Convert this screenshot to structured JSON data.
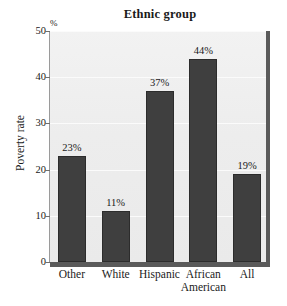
{
  "chart_data": {
    "type": "bar",
    "title": "Ethnic group",
    "xlabel": "",
    "ylabel": "Poverty rate",
    "unit_marker": "%",
    "categories": [
      "Other",
      "White",
      "Hispanic",
      "African\nAmerican",
      "All"
    ],
    "values": [
      23,
      11,
      37,
      44,
      19
    ],
    "data_labels": [
      "23%",
      "11%",
      "37%",
      "44%",
      "19%"
    ],
    "ylim": [
      0,
      50
    ],
    "yticks": [
      0,
      10,
      20,
      30,
      40,
      50
    ],
    "ytick_labels": [
      "0",
      "10",
      "20",
      "30",
      "40",
      "50"
    ],
    "grid": true,
    "legend": null,
    "colors": {
      "bar": "#3f3f3f",
      "bar_edge": "#2c2c2c",
      "plot_background": "#eeeeee",
      "gridline": "#fbfbfb",
      "axis": "#5a5a5a",
      "text": "#1a1a1a",
      "page_background": "#ffffff"
    }
  }
}
